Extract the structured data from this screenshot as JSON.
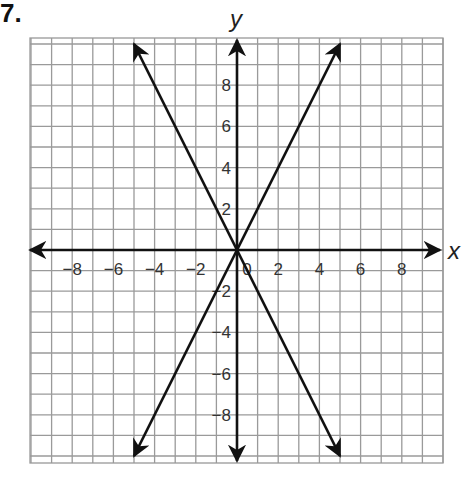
{
  "problem_number": "7.",
  "chart_data": {
    "type": "line",
    "title": "",
    "xlabel": "x",
    "ylabel": "y",
    "xlim": [
      -10,
      10
    ],
    "ylim": [
      -10,
      10
    ],
    "grid": true,
    "x_ticks": [
      -8,
      -6,
      -4,
      -2,
      0,
      2,
      4,
      6,
      8
    ],
    "y_ticks": [
      -8,
      -6,
      -4,
      -2,
      2,
      4,
      6,
      8
    ],
    "series": [
      {
        "name": "y = 2x",
        "x": [
          -5,
          5
        ],
        "y": [
          -10,
          10
        ]
      },
      {
        "name": "y = -2x",
        "x": [
          -5,
          5
        ],
        "y": [
          10,
          -10
        ]
      }
    ]
  },
  "axes": {
    "x_label": "x",
    "y_label": "y"
  }
}
